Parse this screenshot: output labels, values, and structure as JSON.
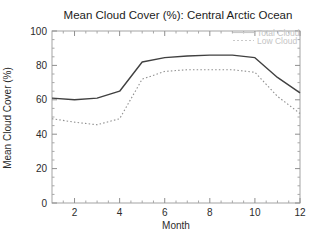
{
  "chart_data": {
    "type": "line",
    "title": "Mean Cloud Cover (%): Central Arctic Ocean",
    "xlabel": "Month",
    "ylabel": "Mean Cloud Cover (%)",
    "xlim": [
      1,
      12
    ],
    "ylim": [
      0,
      100
    ],
    "xticks": [
      2,
      4,
      6,
      8,
      10,
      12
    ],
    "yticks": [
      0,
      20,
      40,
      60,
      80,
      100
    ],
    "x": [
      1,
      2,
      3,
      4,
      5,
      6,
      7,
      8,
      9,
      10,
      11,
      12
    ],
    "series": [
      {
        "name": "Total Cloud",
        "style": "solid",
        "color": "#404040",
        "values": [
          61,
          60,
          61,
          65,
          82,
          84.5,
          85.5,
          86,
          86,
          84.5,
          73,
          64
        ]
      },
      {
        "name": "Low Cloud",
        "style": "dotted",
        "color": "#8f8f8f",
        "values": [
          49,
          47,
          45.5,
          49,
          72,
          76.5,
          77.5,
          77.5,
          77.5,
          76,
          62,
          52
        ]
      }
    ],
    "legend": {
      "position": "top-right",
      "text_color": "#c4c4c4",
      "entries": [
        "Total Cloud",
        "Low Cloud"
      ]
    },
    "grid": false,
    "axis_color": "#a3a3a3"
  }
}
